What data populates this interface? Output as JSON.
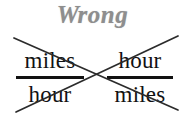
{
  "figure": {
    "title": "Wrong",
    "title_color": "#8e8e8e",
    "background_color": "#ffffff",
    "ink_color": "#121212",
    "strike_color": "#2b2b2b",
    "fractions": [
      {
        "id": "left",
        "numerator": "miles",
        "denominator": "hour"
      },
      {
        "id": "right",
        "numerator": "hour",
        "denominator": "miles"
      }
    ],
    "cross_out": {
      "description": "large X drawn over both fractions",
      "line_down": {
        "x1": 14,
        "y1": 38,
        "x2": 178,
        "y2": 110
      },
      "line_up": {
        "x1": 16,
        "y1": 112,
        "x2": 178,
        "y2": 36
      },
      "intersection": {
        "x": 93,
        "y": 78
      }
    }
  }
}
